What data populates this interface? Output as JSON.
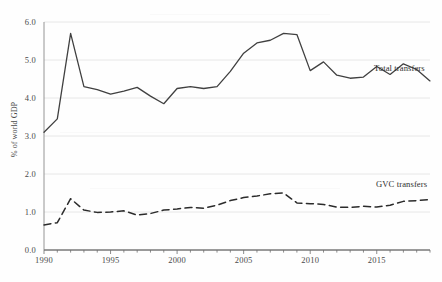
{
  "chart_data": {
    "type": "line",
    "title": "",
    "xlabel": "",
    "ylabel": "% of world GDP",
    "xlim": [
      1990,
      2019
    ],
    "ylim": [
      0.0,
      6.0
    ],
    "grid": true,
    "legend_position": "inline-right",
    "x": [
      1990,
      1991,
      1992,
      1993,
      1994,
      1995,
      1996,
      1997,
      1998,
      1999,
      2000,
      2001,
      2002,
      2003,
      2004,
      2005,
      2006,
      2007,
      2008,
      2009,
      2010,
      2011,
      2012,
      2013,
      2014,
      2015,
      2016,
      2017,
      2018,
      2019
    ],
    "ytick_labels": [
      "0.0",
      "1.0",
      "2.0",
      "3.0",
      "4.0",
      "5.0",
      "6.0"
    ],
    "ytick_values": [
      0.0,
      1.0,
      2.0,
      3.0,
      4.0,
      5.0,
      6.0
    ],
    "xtick_labels": [
      "1990",
      "1995",
      "2000",
      "2005",
      "2010",
      "2015"
    ],
    "xtick_values": [
      1990,
      1995,
      2000,
      2005,
      2010,
      2015
    ],
    "series": [
      {
        "name": "Total transfers",
        "style": "solid",
        "color": "#404040",
        "label_text": "Total transfers",
        "values": [
          3.1,
          3.45,
          5.7,
          4.3,
          4.22,
          4.1,
          4.18,
          4.28,
          4.05,
          3.85,
          4.25,
          4.3,
          4.25,
          4.3,
          4.7,
          5.18,
          5.45,
          5.52,
          5.7,
          5.67,
          4.72,
          4.95,
          4.6,
          4.52,
          4.55,
          4.83,
          4.62,
          4.9,
          4.75,
          4.45
        ]
      },
      {
        "name": "GVC transfers",
        "style": "dashed",
        "color": "#2b2b2b",
        "label_text": "GVC transfers",
        "values": [
          0.66,
          0.72,
          1.35,
          1.05,
          0.99,
          1.0,
          1.03,
          0.92,
          0.96,
          1.05,
          1.08,
          1.12,
          1.1,
          1.18,
          1.3,
          1.38,
          1.42,
          1.48,
          1.5,
          1.24,
          1.22,
          1.2,
          1.13,
          1.12,
          1.15,
          1.13,
          1.18,
          1.28,
          1.3,
          1.33
        ]
      }
    ]
  }
}
